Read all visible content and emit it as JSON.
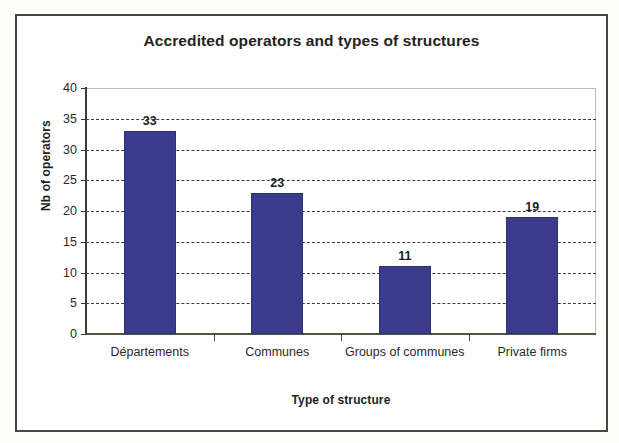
{
  "chart_data": {
    "type": "bar",
    "title": "Accredited operators and types of structures",
    "xlabel": "Type of structure",
    "ylabel": "Nb of operators",
    "categories": [
      "Départements",
      "Communes",
      "Groups of communes",
      "Private firms"
    ],
    "values": [
      33,
      23,
      11,
      19
    ],
    "value_labels": [
      "33",
      "23",
      "11",
      "19"
    ],
    "ylim": [
      0,
      40
    ],
    "yticks": [
      0,
      5,
      10,
      15,
      20,
      25,
      30,
      35,
      40
    ],
    "ytick_labels": [
      "0",
      "5",
      "10",
      "15",
      "20",
      "25",
      "30",
      "35",
      "40"
    ],
    "grid": "horizontal-dashed",
    "legend": "none",
    "bar_color": "#3b3b8c",
    "plot_background": "#ffffff",
    "frame_color": "#4a463c"
  }
}
